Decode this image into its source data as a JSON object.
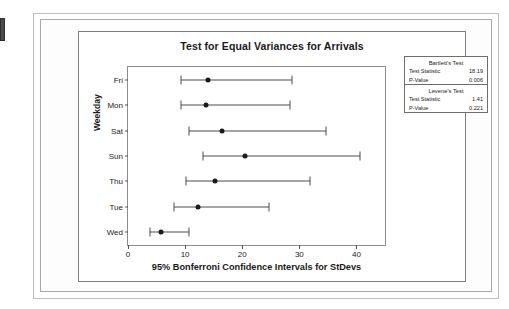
{
  "chart_data": {
    "type": "scatter",
    "title": "Test for Equal Variances for Arrivals",
    "xlabel": "95% Bonferroni Confidence Intervals for StDevs",
    "ylabel": "Weekday",
    "xlim": [
      0,
      45
    ],
    "xticks": [
      0,
      10,
      20,
      30,
      40
    ],
    "xtick_labels": [
      "0",
      "10",
      "20",
      "30",
      "40"
    ],
    "categories": [
      "Fri",
      "Mon",
      "Sat",
      "Sun",
      "Thu",
      "Tue",
      "Wed"
    ],
    "grid": false,
    "legend": "none",
    "series": [
      {
        "name": "Bonferroni CI for StDev",
        "points": [
          {
            "category": "Fri",
            "lower": 9.2,
            "center": 14.0,
            "upper": 28.8
          },
          {
            "category": "Mon",
            "lower": 9.2,
            "center": 13.6,
            "upper": 28.4
          },
          {
            "category": "Sat",
            "lower": 10.7,
            "center": 16.4,
            "upper": 34.6
          },
          {
            "category": "Sun",
            "lower": 13.1,
            "center": 20.4,
            "upper": 40.6
          },
          {
            "category": "Thu",
            "lower": 10.1,
            "center": 15.3,
            "upper": 31.8
          },
          {
            "category": "Tue",
            "lower": 8.0,
            "center": 12.2,
            "upper": 24.7
          },
          {
            "category": "Wed",
            "lower": 3.9,
            "center": 5.8,
            "upper": 10.6
          }
        ]
      }
    ],
    "annotations": {
      "bartlett": {
        "name": "Bartlett's Test",
        "test_statistic": "18.19",
        "p_value": "0.006"
      },
      "levene": {
        "name": "Levene's Test",
        "test_statistic": "1.41",
        "p_value": "0.221"
      }
    }
  },
  "stats_box": {
    "bartlett_title": "Bartlett's Test",
    "levene_title": "Levene's Test",
    "test_statistic_label": "Test Statistic",
    "p_value_label": "P-Value",
    "bartlett_statistic": "18.19",
    "bartlett_p": "0.006",
    "levene_statistic": "1.41",
    "levene_p": "0.221"
  },
  "colors": {
    "line": "#4d4d4d",
    "marker": "#1a1a1a",
    "frame": "#8c8c8c",
    "text": "#1a1a1a"
  }
}
